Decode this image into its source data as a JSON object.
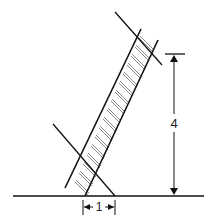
{
  "diagram": {
    "labels": {
      "height": "4",
      "base": "1"
    },
    "colors": {
      "line": "#111111",
      "rung": "#888888",
      "background": "#ffffff"
    }
  }
}
